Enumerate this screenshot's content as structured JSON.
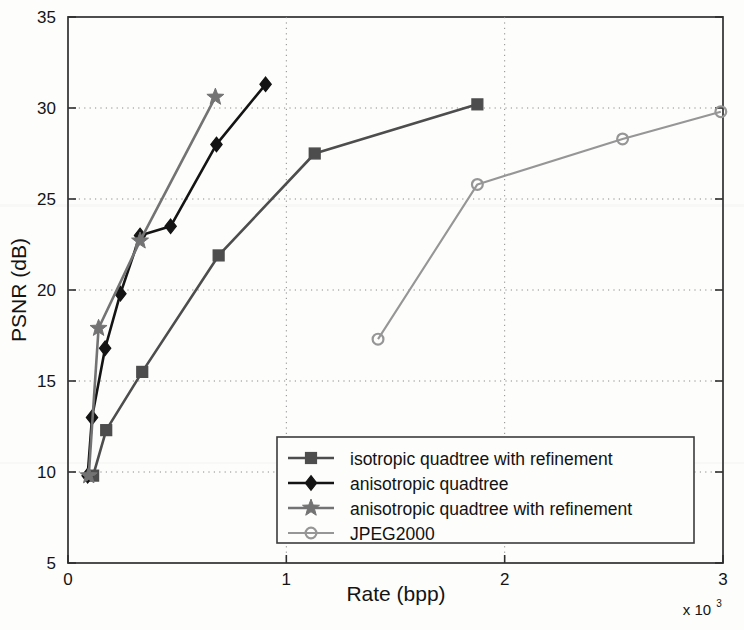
{
  "chart_data": {
    "type": "line",
    "title": "",
    "xlabel": "Rate (bpp)",
    "ylabel": "PSNR (dB)",
    "x_multiplier": "x 10",
    "x_multiplier_exp": "3",
    "xlim": [
      0,
      3000
    ],
    "ylim": [
      5,
      35
    ],
    "xticks": [
      0,
      1000,
      2000,
      3000
    ],
    "xtick_labels": [
      "0",
      "1",
      "2",
      "3"
    ],
    "yticks": [
      5,
      10,
      15,
      20,
      25,
      30,
      35
    ],
    "ytick_labels": [
      "5",
      "10",
      "15",
      "20",
      "25",
      "30",
      "35"
    ],
    "grid": true,
    "grid_style": "dotted",
    "legend_position": "lower right",
    "series": [
      {
        "name": "isotropic quadtree with refinement",
        "marker": "square",
        "color": "#4d4d4d",
        "x": [
          115,
          175,
          340,
          690,
          1130,
          1875
        ],
        "y": [
          9.8,
          12.3,
          15.5,
          21.9,
          27.5,
          30.2
        ]
      },
      {
        "name": "anisotropic quadtree",
        "marker": "diamond",
        "color": "#141414",
        "x": [
          90,
          110,
          170,
          240,
          330,
          470,
          680,
          905
        ],
        "y": [
          9.8,
          13.0,
          16.8,
          19.8,
          23.0,
          23.5,
          28.0,
          31.3
        ]
      },
      {
        "name": "anisotropic quadtree with refinement",
        "marker": "star",
        "color": "#737373",
        "x": [
          95,
          140,
          330,
          675
        ],
        "y": [
          9.8,
          17.9,
          22.7,
          30.6
        ]
      },
      {
        "name": "JPEG2000",
        "marker": "circle",
        "color": "#969696",
        "x": [
          1420,
          1875,
          2540,
          2990
        ],
        "y": [
          17.3,
          25.8,
          28.3,
          29.8
        ]
      }
    ]
  },
  "legend": {
    "entries": [
      {
        "label": "isotropic quadtree with refinement"
      },
      {
        "label": "anisotropic quadtree"
      },
      {
        "label": "anisotropic quadtree with refinement"
      },
      {
        "label": "JPEG2000"
      }
    ]
  }
}
